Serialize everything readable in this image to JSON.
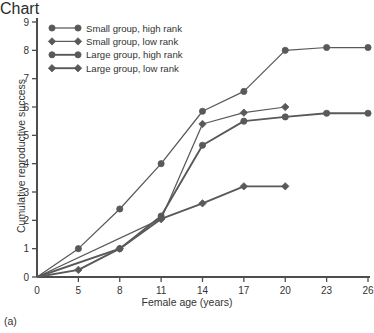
{
  "chart_data": {
    "type": "line",
    "title": "",
    "panel_label": "(a)",
    "xlabel": "Female age (years)",
    "ylabel": "Cumulative reproductive success",
    "categories": [
      0,
      5,
      8,
      11,
      14,
      17,
      20,
      23,
      26
    ],
    "xtick_labels": [
      "0",
      "5",
      "8",
      "11",
      "14",
      "17",
      "20",
      "23",
      "26"
    ],
    "ytick_labels": [
      "0",
      "1",
      "2",
      "3",
      "4",
      "5",
      "6",
      "7",
      "8",
      "9"
    ],
    "ylim": [
      0,
      9
    ],
    "grid": false,
    "legend_position": "top-left",
    "series_color": "#595959",
    "series": [
      {
        "name": "Small group, high rank",
        "marker": "circle",
        "line_width": "thin",
        "x": [
          0,
          5,
          8,
          11,
          14,
          17,
          20,
          23,
          26
        ],
        "values": [
          0,
          1.0,
          2.4,
          4.0,
          5.85,
          6.55,
          8.0,
          8.1,
          8.1
        ]
      },
      {
        "name": "Small group, low rank",
        "marker": "diamond",
        "line_width": "thin",
        "x": [
          0,
          11,
          14,
          17,
          20
        ],
        "values": [
          0,
          2.05,
          5.4,
          5.8,
          6.0
        ]
      },
      {
        "name": "Large group, high rank",
        "marker": "circle",
        "line_width": "thick",
        "x": [
          0,
          8,
          11,
          14,
          17,
          20,
          23,
          26
        ],
        "values": [
          0,
          1.0,
          2.15,
          4.65,
          5.5,
          5.65,
          5.78,
          5.78
        ]
      },
      {
        "name": "Large group, low rank",
        "marker": "diamond",
        "line_width": "thick",
        "x": [
          0,
          5,
          8,
          11,
          14,
          17,
          20
        ],
        "values": [
          0,
          0.25,
          1.0,
          2.05,
          2.6,
          3.2,
          3.2
        ]
      }
    ],
    "legend_entries": [
      "Small group, high rank",
      "Small group, low rank",
      "Large group, high rank",
      "Large group, low rank"
    ]
  }
}
